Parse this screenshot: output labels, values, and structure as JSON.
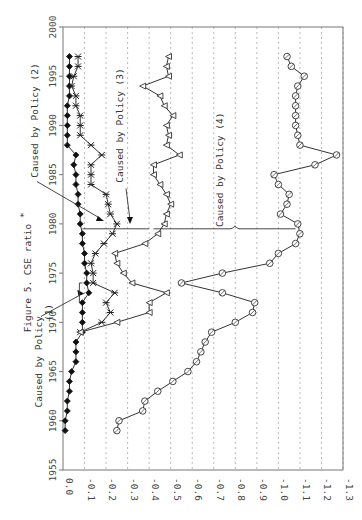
{
  "chart_data": {
    "type": "line",
    "orientation": "rotated-90",
    "title": "Figure 5. CSE ratio",
    "title_superscript": "*",
    "xlabel": "",
    "ylabel": "",
    "value_axis": {
      "range": [
        0.0,
        -1.3
      ],
      "ticks": [
        "0.0",
        "-0.1",
        "-0.2",
        "-0.3",
        "-0.4",
        "-0.5",
        "-0.6",
        "-0.7",
        "-0.8",
        "-0.9",
        "-1.0",
        "-1.1",
        "-1.2",
        "-1.3"
      ],
      "tick_values": [
        0.0,
        -0.1,
        -0.2,
        -0.3,
        -0.4,
        -0.5,
        -0.6,
        -0.7,
        -0.8,
        -0.9,
        -1.0,
        -1.1,
        -1.2,
        -1.3
      ],
      "grid": true
    },
    "year_axis": {
      "range": [
        1955,
        2000
      ],
      "ticks": [
        "1955",
        "1960",
        "1965",
        "1970",
        "1975",
        "1980",
        "1985",
        "1990",
        "1995",
        "2000"
      ],
      "tick_values": [
        1955,
        1960,
        1965,
        1970,
        1975,
        1980,
        1985,
        1990,
        1995,
        2000
      ]
    },
    "series": [
      {
        "name": "diamond",
        "marker": "filled-diamond",
        "x": [
          1959,
          1960,
          1961,
          1962,
          1963,
          1964,
          1965,
          1966,
          1967,
          1968,
          1969,
          1970,
          1971,
          1972,
          1973,
          1974,
          1975,
          1976,
          1977,
          1978,
          1979,
          1980,
          1981,
          1982,
          1983,
          1984,
          1985,
          1986,
          1987,
          1988,
          1989,
          1990,
          1991,
          1992,
          1993,
          1994,
          1995,
          1996,
          1997
        ],
        "values": [
          -0.01,
          -0.01,
          -0.02,
          -0.02,
          -0.03,
          -0.03,
          -0.04,
          -0.06,
          -0.06,
          -0.06,
          -0.09,
          -0.09,
          -0.09,
          -0.09,
          -0.12,
          -0.11,
          -0.11,
          -0.1,
          -0.1,
          -0.09,
          -0.09,
          -0.08,
          -0.08,
          -0.07,
          -0.07,
          -0.06,
          -0.06,
          -0.05,
          -0.06,
          -0.02,
          -0.02,
          -0.02,
          -0.02,
          -0.02,
          -0.03,
          -0.03,
          -0.03,
          -0.03,
          -0.03
        ]
      },
      {
        "name": "star",
        "marker": "asterisk",
        "x": [
          1969,
          1970,
          1971,
          1972,
          1973,
          1974,
          1975,
          1976,
          1977,
          1978,
          1979,
          1980,
          1981,
          1982,
          1983,
          1984,
          1985,
          1986,
          1987,
          1988,
          1989,
          1990,
          1991,
          1992,
          1993,
          1994,
          1995,
          1996,
          1997
        ],
        "values": [
          -0.08,
          -0.18,
          -0.22,
          -0.2,
          -0.24,
          -0.14,
          -0.14,
          -0.13,
          -0.15,
          -0.19,
          -0.23,
          -0.25,
          -0.22,
          -0.21,
          -0.2,
          -0.13,
          -0.13,
          -0.13,
          -0.18,
          -0.13,
          -0.08,
          -0.08,
          -0.08,
          -0.06,
          -0.06,
          -0.04,
          -0.05,
          -0.07,
          -0.07
        ]
      },
      {
        "name": "triangle",
        "marker": "open-triangle",
        "x": [
          1969,
          1970,
          1971,
          1972,
          1973,
          1974,
          1975,
          1976,
          1977,
          1978,
          1979,
          1980,
          1981,
          1982,
          1983,
          1984,
          1985,
          1986,
          1987,
          1988,
          1989,
          1990,
          1991,
          1992,
          1993,
          1994,
          1995,
          1996,
          1997
        ],
        "values": [
          -0.08,
          -0.25,
          -0.4,
          -0.4,
          -0.48,
          -0.32,
          -0.28,
          -0.25,
          -0.24,
          -0.38,
          -0.44,
          -0.47,
          -0.48,
          -0.5,
          -0.48,
          -0.45,
          -0.42,
          -0.42,
          -0.54,
          -0.48,
          -0.49,
          -0.48,
          -0.51,
          -0.47,
          -0.45,
          -0.37,
          -0.49,
          -0.48,
          -0.49
        ]
      },
      {
        "name": "circle",
        "marker": "open-circle",
        "x": [
          1959,
          1960,
          1961,
          1962,
          1963,
          1964,
          1965,
          1966,
          1967,
          1968,
          1969,
          1970,
          1971,
          1972,
          1973,
          1974,
          1975,
          1976,
          1977,
          1978,
          1979,
          1980,
          1981,
          1982,
          1983,
          1984,
          1985,
          1986,
          1987,
          1988,
          1989,
          1990,
          1991,
          1992,
          1993,
          1994,
          1995,
          1996,
          1997
        ],
        "values": [
          -0.25,
          -0.26,
          -0.37,
          -0.38,
          -0.44,
          -0.51,
          -0.58,
          -0.62,
          -0.64,
          -0.66,
          -0.69,
          -0.8,
          -0.88,
          -0.89,
          -0.74,
          -0.55,
          -0.74,
          -0.96,
          -1.0,
          -1.08,
          -1.1,
          -1.09,
          -1.01,
          -1.04,
          -1.05,
          -1.0,
          -0.98,
          -1.17,
          -1.27,
          -1.1,
          -1.09,
          -1.08,
          -1.08,
          -1.08,
          -1.08,
          -1.09,
          -1.12,
          -1.06,
          -1.04
        ]
      }
    ],
    "annotations": [
      {
        "text": "Caused by Policy (1)",
        "points_to_year": 1973,
        "series": "diamond"
      },
      {
        "text": "Caused by Policy (2)",
        "points_to_year": 1980,
        "series": "diamond"
      },
      {
        "text": "Caused by Policy (3)",
        "points_to_year": 1980,
        "series": "star"
      },
      {
        "text": "Caused by Policy (4)",
        "points_to_year": 1980,
        "series": "triangle-to-circle"
      }
    ],
    "legend": "none"
  }
}
